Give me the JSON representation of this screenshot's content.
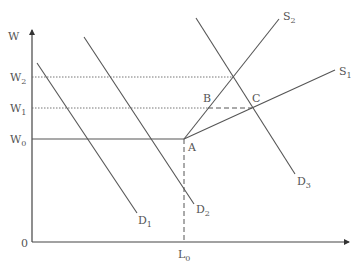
{
  "diagram": {
    "title": "",
    "colors": {
      "line": "#555555",
      "axis": "#444444",
      "text": "#555555",
      "background": "#ffffff"
    },
    "axes": {
      "y_label": "W",
      "origin_label": "0",
      "x_tick_label": {
        "base": "L",
        "sub": "0"
      },
      "y_tick_labels": [
        {
          "base": "W",
          "sub": "2"
        },
        {
          "base": "W",
          "sub": "1"
        },
        {
          "base": "W",
          "sub": "0"
        }
      ]
    },
    "curves": {
      "supply": [
        {
          "base": "S",
          "sub": "2",
          "description": "steep supply curve from A through B"
        },
        {
          "base": "S",
          "sub": "1",
          "description": "flatter supply curve from A through C"
        }
      ],
      "demand": [
        {
          "base": "D",
          "sub": "1"
        },
        {
          "base": "D",
          "sub": "2"
        },
        {
          "base": "D",
          "sub": "3"
        }
      ]
    },
    "points": [
      {
        "label": "A"
      },
      {
        "label": "B"
      },
      {
        "label": "C"
      }
    ]
  }
}
